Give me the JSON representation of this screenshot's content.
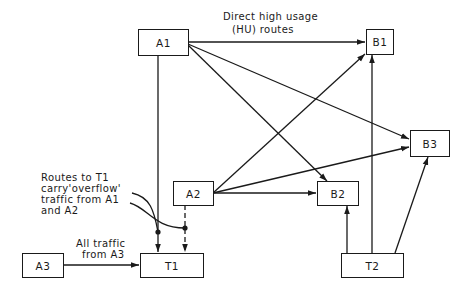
{
  "diagram": {
    "nodes": {
      "A1": "A1",
      "A2": "A2",
      "A3": "A3",
      "B1": "B1",
      "B2": "B2",
      "B3": "B3",
      "T1": "T1",
      "T2": "T2"
    },
    "annotations": {
      "hu_routes_line1": "Direct high usage",
      "hu_routes_line2": "(HU) routes",
      "overflow_line1": "Routes to T1",
      "overflow_line2": "carry'overflow'",
      "overflow_line3": "traffic from A1",
      "overflow_line4": "and A2",
      "a3_line1": "All traffic",
      "a3_line2": "from A3"
    },
    "edges": [
      {
        "from": "A1",
        "to": "B1",
        "style": "solid"
      },
      {
        "from": "A1",
        "to": "B2",
        "style": "solid"
      },
      {
        "from": "A1",
        "to": "B3",
        "style": "solid"
      },
      {
        "from": "A1",
        "to": "T1",
        "style": "solid"
      },
      {
        "from": "A2",
        "to": "B1",
        "style": "solid"
      },
      {
        "from": "A2",
        "to": "B2",
        "style": "solid"
      },
      {
        "from": "A2",
        "to": "B3",
        "style": "solid"
      },
      {
        "from": "A2",
        "to": "T1",
        "style": "dashed"
      },
      {
        "from": "A3",
        "to": "T1",
        "style": "solid"
      },
      {
        "from": "T2",
        "to": "B1",
        "style": "solid"
      },
      {
        "from": "T2",
        "to": "B2",
        "style": "solid"
      },
      {
        "from": "T2",
        "to": "B3",
        "style": "solid"
      }
    ],
    "colors": {
      "line": "#1a1a1a",
      "background": "#ffffff"
    }
  }
}
